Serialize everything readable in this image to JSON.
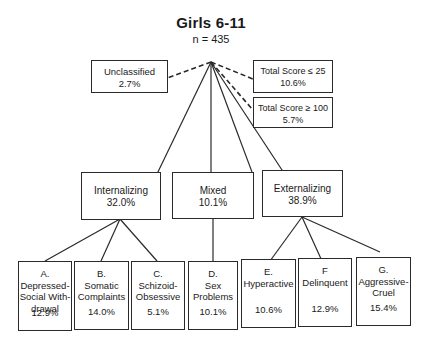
{
  "title": "Girls 6-11",
  "n_label": "n = 435",
  "top_boxes": {
    "unclassified": {
      "label": "Unclassified",
      "pct": "2.7%"
    },
    "low_score": {
      "label": "Total Score ≤ 25",
      "pct": "10.6%"
    },
    "high_score": {
      "label": "Total Score ≥ 100",
      "pct": "5.7%"
    }
  },
  "groups": [
    {
      "label": "Internalizing",
      "pct": "32.0%"
    },
    {
      "label": "Mixed",
      "pct": "10.1%"
    },
    {
      "label": "Externalizing",
      "pct": "38.9%"
    }
  ],
  "leaves": [
    {
      "letter": "A.",
      "lines": [
        "Depressed-",
        "Social With-",
        "drawal"
      ],
      "pct": "12.9%"
    },
    {
      "letter": "B.",
      "lines": [
        "Somatic",
        "Complaints",
        ""
      ],
      "pct": "14.0%"
    },
    {
      "letter": "C.",
      "lines": [
        "Schizoid-",
        "Obsessive",
        ""
      ],
      "pct": "5.1%"
    },
    {
      "letter": "D.",
      "lines": [
        "Sex",
        "Problems",
        ""
      ],
      "pct": "10.1%"
    },
    {
      "letter": "E.",
      "lines": [
        "Hyperactive",
        "",
        ""
      ],
      "pct": "10.6%"
    },
    {
      "letter": "F",
      "lines": [
        "Delinquent",
        "",
        ""
      ],
      "pct": "12.9%"
    },
    {
      "letter": "G.",
      "lines": [
        "Aggressive-",
        "Cruel",
        ""
      ],
      "pct": "15.4%"
    }
  ]
}
